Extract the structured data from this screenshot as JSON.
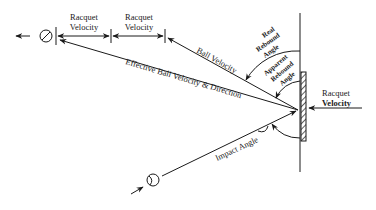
{
  "diagram": {
    "labels": {
      "racquet_velocity_1_line1": "Racquet",
      "racquet_velocity_1_line2": "Velocity",
      "racquet_velocity_2_line1": "Racquet",
      "racquet_velocity_2_line2": "Velocity",
      "ball_velocity": "Ball Velocity",
      "effective_ball_velocity": "Effective Ball Velocity & Direction",
      "real_rebound_line1": "Real",
      "real_rebound_line2": "Rebound",
      "real_rebound_line3": "Angle",
      "apparent_rebound_line1": "Apparent",
      "apparent_rebound_line2": "Rebound",
      "apparent_rebound_line3": "Angle",
      "racquet_velocity_right_line1": "Racquet",
      "racquet_velocity_right_line2": "Velocity",
      "impact_angle": "Impact Angle"
    },
    "colors": {
      "ink": "#1a1a1a",
      "background": "#ffffff"
    }
  }
}
